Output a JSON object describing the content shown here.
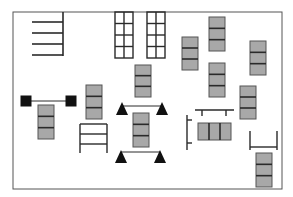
{
  "diagram": {
    "title": "",
    "colors": {
      "line": "#2a2a2a",
      "fill_gray": "#a8a8a8",
      "fill_black": "#111111",
      "border": "#555555"
    },
    "border": {
      "x": 13,
      "y": 12,
      "w": 269,
      "h": 177
    },
    "shelves": {
      "vline": {
        "x": 63,
        "y1": 12,
        "y2": 56
      },
      "rows": [
        22,
        33,
        44,
        55
      ],
      "x1": 32
    },
    "grids": [
      {
        "x": 115,
        "y": 12,
        "w": 18,
        "h": 46,
        "cols": 2,
        "rows": 4
      },
      {
        "x": 147,
        "y": 12,
        "w": 18,
        "h": 46,
        "cols": 2,
        "rows": 4
      }
    ],
    "stacks_vertical": [
      {
        "x": 38,
        "y": 105,
        "w": 16,
        "h": 34
      },
      {
        "x": 86,
        "y": 85,
        "w": 16,
        "h": 34
      },
      {
        "x": 135,
        "y": 65,
        "w": 16,
        "h": 32
      },
      {
        "x": 133,
        "y": 113,
        "w": 16,
        "h": 34
      },
      {
        "x": 182,
        "y": 37,
        "w": 16,
        "h": 33
      },
      {
        "x": 209,
        "y": 17,
        "w": 16,
        "h": 34
      },
      {
        "x": 209,
        "y": 63,
        "w": 16,
        "h": 34
      },
      {
        "x": 250,
        "y": 41,
        "w": 16,
        "h": 34
      },
      {
        "x": 240,
        "y": 86,
        "w": 16,
        "h": 33
      },
      {
        "x": 256,
        "y": 153,
        "w": 16,
        "h": 34
      }
    ],
    "stack_horizontal": {
      "x": 198,
      "y": 123,
      "w": 33,
      "h": 17
    },
    "dumbbell": {
      "x1": 26,
      "x2": 71,
      "y": 101,
      "size": 11
    },
    "triangles": [
      {
        "x": 122,
        "y": 109
      },
      {
        "x": 162,
        "y": 109
      },
      {
        "x": 121,
        "y": 157
      },
      {
        "x": 160,
        "y": 157
      }
    ],
    "ladder": {
      "x": 80,
      "y": 124,
      "w": 27,
      "h": 29,
      "rungs": [
        124,
        134,
        144
      ]
    },
    "t_bench": {
      "x1": 195,
      "x2": 234,
      "y": 110,
      "legs": [
        202,
        226
      ]
    },
    "bracket": {
      "x": 187,
      "y1": 115,
      "y2": 150,
      "ticks": [
        120,
        143
      ]
    },
    "u_shape": {
      "x1": 250,
      "x2": 277,
      "y_top": 131,
      "y_bot": 150
    }
  }
}
